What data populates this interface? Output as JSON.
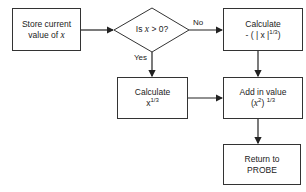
{
  "nodes": {
    "store": {
      "line1": "Store current",
      "line2_prefix": "value of ",
      "line2_var": "x"
    },
    "decision": {
      "prefix": "Is ",
      "var": "x",
      "suffix": " > 0?"
    },
    "calc_neg": {
      "line1": "Calculate",
      "line2_base": "- ( | x |",
      "line2_sup": "1/3",
      "line2_end": ")"
    },
    "calc_pos": {
      "line1": "Calculate",
      "line2_base": "x",
      "line2_sup": "1/3"
    },
    "add": {
      "line1": "Add in value",
      "line2_open": "(",
      "line2_var": "x",
      "line2_sup1": "2",
      "line2_close": ")",
      "line2_sup2": "1/3"
    },
    "return": {
      "line1": "Return to",
      "line2": "PROBE"
    }
  },
  "edges": {
    "no_label": "No",
    "yes_label": "Yes"
  },
  "colors": {
    "stroke": "#333333",
    "background": "#ffffff",
    "text": "#222222"
  }
}
